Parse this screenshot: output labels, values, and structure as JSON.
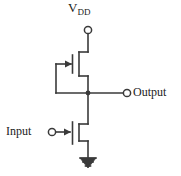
{
  "diagram": {
    "type": "circuit-schematic",
    "stroke_color": "#3a3a3a",
    "text_color": "#1a1a1a",
    "background_color": "#ffffff",
    "labels": {
      "supply": "V",
      "supply_subscript": "DD",
      "output": "Output",
      "input": "Input"
    },
    "nodes": [
      {
        "name": "vdd-terminal",
        "kind": "open-circle",
        "x": 88,
        "y": 30
      },
      {
        "name": "output-terminal",
        "kind": "open-circle",
        "x": 127,
        "y": 93
      },
      {
        "name": "input-terminal",
        "kind": "open-circle",
        "x": 52,
        "y": 132
      },
      {
        "name": "output-junction",
        "kind": "filled-dot",
        "x": 88,
        "y": 93
      },
      {
        "name": "ground-symbol",
        "kind": "ground",
        "x": 88,
        "y": 158
      }
    ],
    "transistors": [
      {
        "name": "load-transistor",
        "role": "pull-up load",
        "gate_arrow_direction": "right",
        "gate_x": 73,
        "channel_x": 79,
        "top_y": 52,
        "bottom_y": 76,
        "gate_y": 64
      },
      {
        "name": "driver-transistor",
        "role": "pull-down driver",
        "gate_arrow_direction": "right",
        "gate_x": 73,
        "channel_x": 79,
        "top_y": 124,
        "bottom_y": 141,
        "gate_y": 132
      }
    ]
  }
}
